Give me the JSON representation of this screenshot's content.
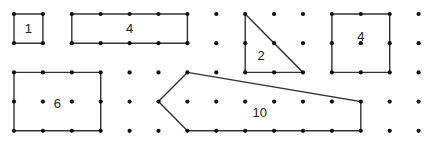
{
  "grid": {
    "cols": 15,
    "rows": 5,
    "x0": 14,
    "y0": 14,
    "dx": 28.9,
    "dy": 29.2,
    "dot_color": "#111111",
    "line_color": "#333333"
  },
  "shapes": [
    {
      "name": "square-1",
      "label": "1",
      "points": [
        [
          0,
          0
        ],
        [
          1,
          0
        ],
        [
          1,
          1
        ],
        [
          0,
          1
        ]
      ],
      "label_pos": [
        0.5,
        0.55
      ]
    },
    {
      "name": "rectangle-4",
      "label": "4",
      "points": [
        [
          2,
          0
        ],
        [
          6,
          0
        ],
        [
          6,
          1
        ],
        [
          2,
          1
        ]
      ],
      "label_pos": [
        4,
        0.55
      ]
    },
    {
      "name": "triangle-2",
      "label": "2",
      "points": [
        [
          8,
          0
        ],
        [
          10,
          2
        ],
        [
          8,
          2
        ]
      ],
      "label_pos": [
        8.55,
        1.45
      ]
    },
    {
      "name": "square-4",
      "label": "4",
      "points": [
        [
          11,
          0
        ],
        [
          13,
          0
        ],
        [
          13,
          2
        ],
        [
          11,
          2
        ]
      ],
      "label_pos": [
        12,
        0.8
      ]
    },
    {
      "name": "rectangle-6",
      "label": "6",
      "points": [
        [
          0,
          2
        ],
        [
          3,
          2
        ],
        [
          3,
          4
        ],
        [
          0,
          4
        ]
      ],
      "label_pos": [
        1.5,
        3.1
      ]
    },
    {
      "name": "pentagon-10",
      "label": "10",
      "points": [
        [
          6,
          2
        ],
        [
          12,
          3
        ],
        [
          12,
          4
        ],
        [
          6,
          4
        ],
        [
          5,
          3
        ]
      ],
      "label_pos": [
        8.5,
        3.4
      ]
    }
  ]
}
